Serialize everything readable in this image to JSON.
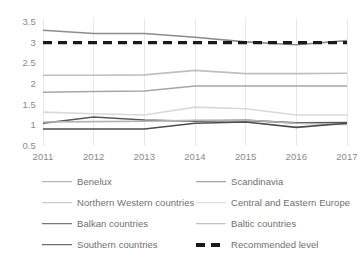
{
  "chart_data": {
    "type": "line",
    "title": "",
    "xlabel": "",
    "ylabel": "",
    "x": [
      2011,
      2012,
      2013,
      2014,
      2015,
      2016,
      2017
    ],
    "categories": [
      "2011",
      "2012",
      "2013",
      "2014",
      "2015",
      "2016",
      "2017"
    ],
    "ylim": [
      0.5,
      3.5
    ],
    "yticks": [
      0.5,
      1,
      1.5,
      2,
      2.5,
      3,
      3.5
    ],
    "ytick_labels": [
      "0.5",
      "1",
      "1.5",
      "2",
      "2.5",
      "3",
      "3.5"
    ],
    "grid": "vertical",
    "legend_position": "bottom",
    "legend_columns": 2,
    "series": [
      {
        "name": "Benelux",
        "color": "#a6a6a6",
        "style": "solid",
        "width": 1.6,
        "values": [
          1.8,
          1.82,
          1.83,
          1.95,
          1.95,
          1.95,
          1.95
        ]
      },
      {
        "name": "Scandinavia",
        "color": "#8c8c8c",
        "style": "solid",
        "width": 1.6,
        "values": [
          3.3,
          3.22,
          3.22,
          3.13,
          3.02,
          2.95,
          3.05
        ]
      },
      {
        "name": "Northern Western countries",
        "color": "#bfbfbf",
        "style": "solid",
        "width": 1.6,
        "values": [
          2.21,
          2.21,
          2.22,
          2.33,
          2.25,
          2.25,
          2.26
        ]
      },
      {
        "name": "Central and Eastern Europe",
        "color": "#d9d9d9",
        "style": "solid",
        "width": 1.6,
        "values": [
          1.32,
          1.28,
          1.25,
          1.44,
          1.4,
          1.25,
          1.25
        ]
      },
      {
        "name": "Balkan countries",
        "color": "#595959",
        "style": "solid",
        "width": 1.6,
        "values": [
          1.05,
          1.2,
          1.13,
          1.1,
          1.12,
          1.06,
          1.07
        ]
      },
      {
        "name": "Baltic countries",
        "color": "#b3b3b3",
        "style": "solid",
        "width": 1.6,
        "values": [
          1.08,
          1.09,
          1.1,
          1.12,
          1.13,
          1.05,
          1.02
        ]
      },
      {
        "name": "Southern countries",
        "color": "#4d4d4d",
        "style": "solid",
        "width": 1.6,
        "values": [
          0.91,
          0.91,
          0.91,
          1.05,
          1.08,
          0.95,
          1.05
        ]
      },
      {
        "name": "Recommended level",
        "color": "#1a1a1a",
        "style": "dashed",
        "width": 3.2,
        "values": [
          3.0,
          3.0,
          3.0,
          3.0,
          3.0,
          3.0,
          3.0
        ]
      }
    ]
  },
  "legend": {
    "rows": [
      {
        "left": "Benelux",
        "right": "Scandinavia"
      },
      {
        "left": "Northern Western countries",
        "right": "Central and Eastern Europe"
      },
      {
        "left": "Balkan countries",
        "right": "Baltic countries"
      },
      {
        "left": "Southern countries",
        "right": "Recommended level"
      }
    ]
  },
  "colors": {
    "axis_text": "#8a8a8a",
    "gridline": "#e8e8e8",
    "plot_background": "#ffffff"
  }
}
